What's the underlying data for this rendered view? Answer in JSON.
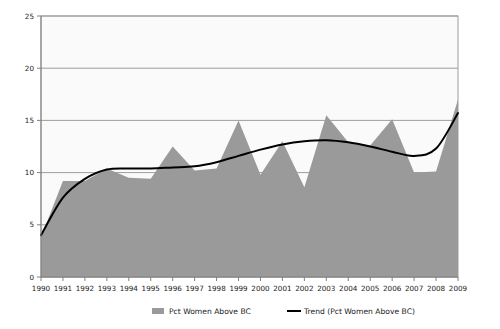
{
  "chart_data": {
    "type": "area",
    "title": "",
    "subtitle": "",
    "xlabel": "",
    "ylabel": "",
    "categories": [
      "1990",
      "1991",
      "1992",
      "1993",
      "1994",
      "1995",
      "1996",
      "1997",
      "1998",
      "1999",
      "2000",
      "2001",
      "2002",
      "2003",
      "2004",
      "2005",
      "2006",
      "2007",
      "2008",
      "2009"
    ],
    "series": [
      {
        "name": "Pct Women Above BC",
        "type": "area",
        "color": "#9a9a9a",
        "values": [
          3.8,
          9.2,
          9.2,
          10.4,
          9.5,
          9.4,
          12.5,
          10.2,
          10.4,
          15.0,
          9.8,
          13.0,
          8.6,
          15.5,
          12.9,
          12.6,
          15.1,
          10.0,
          10.1,
          17.0
        ]
      },
      {
        "name": "Trend (Pct Women Above BC)",
        "type": "line",
        "color": "#000000",
        "values": [
          4.0,
          7.6,
          9.4,
          10.3,
          10.4,
          10.4,
          10.5,
          10.6,
          11.0,
          11.6,
          12.2,
          12.7,
          13.0,
          13.1,
          12.9,
          12.5,
          12.0,
          11.6,
          12.3,
          15.7
        ]
      }
    ],
    "ylim": [
      0,
      25
    ],
    "yticks": [
      0,
      5,
      10,
      15,
      20,
      25
    ],
    "ytick_labels": [
      "0",
      "5",
      "10",
      "15",
      "20",
      "25"
    ],
    "grid": true,
    "grid_axis": "y",
    "legend_position": "bottom"
  },
  "legend": {
    "items": [
      {
        "label": "Pct Women Above BC",
        "marker": "swatch",
        "color": "#9a9a9a"
      },
      {
        "label": "Trend (Pct Women Above BC)",
        "marker": "line",
        "color": "#000000"
      }
    ]
  },
  "colors": {
    "background": "#ffffff",
    "plot_background": "#fafafa",
    "area_fill": "#9a9a9a",
    "trend_line": "#000000",
    "grid_line": "#9d9d9d",
    "axis_line": "#808080",
    "text": "#1a1a1a"
  }
}
